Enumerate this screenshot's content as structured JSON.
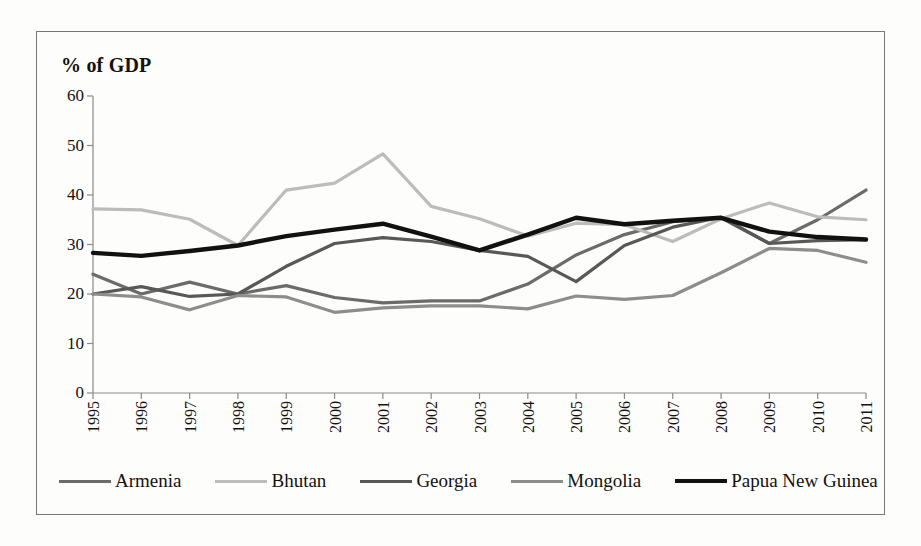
{
  "chart_data": {
    "type": "line",
    "title": "",
    "subtitle": "",
    "ylabel": "% of GDP",
    "xlabel": "",
    "ylim": [
      0,
      60
    ],
    "yticks": [
      0,
      10,
      20,
      30,
      40,
      50,
      60
    ],
    "grid": false,
    "legend_position": "bottom",
    "x": [
      1995,
      1996,
      1997,
      1998,
      1999,
      2000,
      2001,
      2002,
      2003,
      2004,
      2005,
      2006,
      2007,
      2008,
      2009,
      2010,
      2011
    ],
    "categories": [
      "1995",
      "1996",
      "1997",
      "1998",
      "1999",
      "2000",
      "2001",
      "2002",
      "2003",
      "2004",
      "2005",
      "2006",
      "2007",
      "2008",
      "2009",
      "2010",
      "2011"
    ],
    "series": [
      {
        "name": "Armenia",
        "color": "#6b6b6b",
        "width": 3.2,
        "values": [
          24.0,
          20.0,
          22.4,
          20.0,
          21.7,
          19.3,
          18.2,
          18.6,
          18.6,
          22.0,
          27.9,
          32.0,
          34.6,
          35.4,
          30.2,
          35.0,
          41.0
        ]
      },
      {
        "name": "Bhutan",
        "color": "#bcbcbc",
        "width": 3.2,
        "values": [
          37.2,
          37.0,
          35.1,
          29.8,
          41.0,
          42.4,
          48.3,
          37.7,
          35.2,
          31.7,
          34.3,
          34.0,
          30.6,
          35.2,
          38.4,
          35.6,
          35.0
        ]
      },
      {
        "name": "Georgia",
        "color": "#585858",
        "width": 3.2,
        "values": [
          20.0,
          21.5,
          19.5,
          20.0,
          25.6,
          30.2,
          31.4,
          30.6,
          28.8,
          27.6,
          22.5,
          29.8,
          33.5,
          35.5,
          30.2,
          30.8,
          31.0
        ]
      },
      {
        "name": "Mongolia",
        "color": "#8d8d8d",
        "width": 3.2,
        "values": [
          20.0,
          19.4,
          16.8,
          19.7,
          19.4,
          16.3,
          17.2,
          17.6,
          17.6,
          17.0,
          19.6,
          18.9,
          19.7,
          24.3,
          29.2,
          28.8,
          26.4
        ]
      },
      {
        "name": "Papua New Guinea",
        "color": "#111111",
        "width": 4.4,
        "values": [
          28.3,
          27.7,
          28.7,
          29.8,
          31.7,
          33.0,
          34.2,
          31.6,
          28.8,
          32.0,
          35.4,
          34.1,
          34.8,
          35.4,
          32.6,
          31.5,
          31.0
        ]
      }
    ]
  },
  "figure": {
    "axis_title": "% of GDP"
  },
  "legend": {
    "items": [
      {
        "label": "Armenia"
      },
      {
        "label": "Bhutan"
      },
      {
        "label": "Georgia"
      },
      {
        "label": "Mongolia"
      },
      {
        "label": "Papua New Guinea"
      }
    ]
  }
}
